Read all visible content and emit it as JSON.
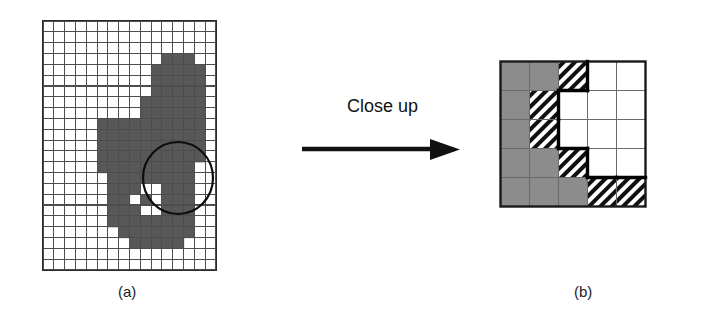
{
  "figure": {
    "caption_a": "(a)",
    "caption_b": "(b)",
    "transition_label": "Close up"
  },
  "colors": {
    "object_gray": "#8c8c8c",
    "blob_gray": "#585858",
    "background_white": "#ffffff",
    "line_black": "#1a1a1a",
    "grid_line": "#4d4d4d"
  },
  "panel_a": {
    "name": "original-image-grid",
    "cols": 16,
    "rows": 23,
    "cell_px": 10.8,
    "legend": "0 = background pixel (white), 1 = object pixel (dark gray)",
    "circle_highlight": {
      "cx": 135,
      "cy": 157,
      "rx": 35,
      "ry": 36
    },
    "pixels": [
      "0000000000000000",
      "0000000000000000",
      "0000000000000000",
      "0000000000011100",
      "0000000000111110",
      "0000000000111110",
      "0000000000111110",
      "0000000001111110",
      "0000000001111110",
      "0000011111111110",
      "0000011111111110",
      "0000011111111110",
      "0000011111111110",
      "0000011111111100",
      "0000001111111100",
      "0000001110011100",
      "0000001101011100",
      "0000001110011100",
      "0000001111111100",
      "0000000111111100",
      "0000000011111000",
      "0000000000000000",
      "0000000000000000"
    ]
  },
  "panel_b": {
    "name": "closeup-grid",
    "cols": 5,
    "rows": 5,
    "cell_px": 29,
    "legend": "G = object interior (solid gray), H = boundary pixel (hatched), W = background (white)",
    "cells": [
      [
        "G",
        "G",
        "H",
        "W",
        "W"
      ],
      [
        "G",
        "H",
        "W",
        "W",
        "W"
      ],
      [
        "G",
        "H",
        "W",
        "W",
        "W"
      ],
      [
        "G",
        "G",
        "H",
        "W",
        "W"
      ],
      [
        "G",
        "G",
        "G",
        "H",
        "H"
      ]
    ]
  }
}
